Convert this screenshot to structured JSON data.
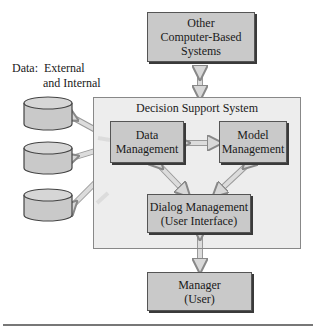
{
  "diagram": {
    "nodes": {
      "other_systems": {
        "lines": [
          "Other",
          "Computer-Based",
          "Systems"
        ]
      },
      "dss": {
        "title": "Decision Support System"
      },
      "data_management": {
        "lines": [
          "Data",
          "Management"
        ]
      },
      "model_management": {
        "lines": [
          "Model",
          "Management"
        ]
      },
      "dialog_management": {
        "lines": [
          "Dialog Management",
          "(User Interface)"
        ]
      },
      "manager": {
        "lines": [
          "Manager",
          "(User)"
        ]
      }
    },
    "data_label": {
      "line1": "Data:  External",
      "line2": "and Internal"
    },
    "databases": [
      {
        "name": "database-1"
      },
      {
        "name": "database-2"
      },
      {
        "name": "database-3"
      }
    ],
    "edges": [
      {
        "from": "other_systems",
        "to": "dss",
        "type": "bidirectional"
      },
      {
        "from": "database-1",
        "to": "data_management",
        "type": "bidirectional"
      },
      {
        "from": "database-2",
        "to": "data_management",
        "type": "bidirectional"
      },
      {
        "from": "database-3",
        "to": "data_management",
        "type": "bidirectional"
      },
      {
        "from": "data_management",
        "to": "model_management",
        "type": "bidirectional"
      },
      {
        "from": "data_management",
        "to": "dialog_management",
        "type": "bidirectional"
      },
      {
        "from": "model_management",
        "to": "dialog_management",
        "type": "bidirectional"
      },
      {
        "from": "dialog_management",
        "to": "manager",
        "type": "bidirectional"
      }
    ],
    "colors": {
      "box_fill": "#c9c9c9",
      "dss_fill": "#ededed",
      "arrow_fill": "#d8d8d8",
      "shadow": "#3a3a3a"
    }
  }
}
